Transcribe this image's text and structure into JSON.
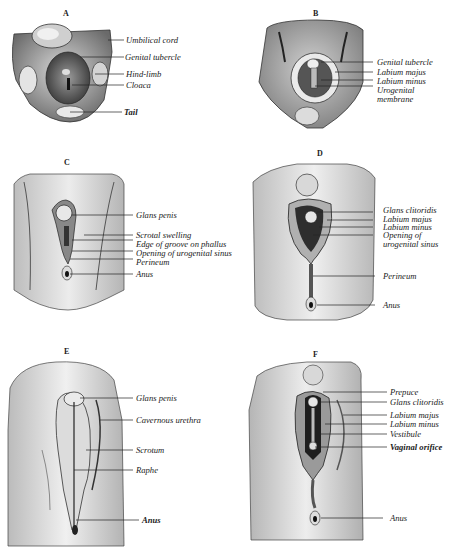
{
  "figure": {
    "panels": [
      {
        "id": "A",
        "letter": "A",
        "labels": [
          "Umbilical cord",
          "Genital tubercle",
          "Hind-limb",
          "Cloaca",
          "Tail"
        ]
      },
      {
        "id": "B",
        "letter": "B",
        "labels": [
          "Genital tubercle",
          "Labium majus",
          "Labium minus",
          "Urogenital",
          "membrane"
        ]
      },
      {
        "id": "C",
        "letter": "C",
        "labels": [
          "Glans penis",
          "Scrotal swelling",
          "Edge of groove on phallus",
          "Opening of urogenital sinus",
          "Perineum",
          "Anus"
        ]
      },
      {
        "id": "D",
        "letter": "D",
        "labels": [
          "Glans clitoridis",
          "Labium majus",
          "Labium minus",
          "Opening of",
          "urogenital sinus",
          "Perineum",
          "Anus"
        ]
      },
      {
        "id": "E",
        "letter": "E",
        "labels": [
          "Glans penis",
          "Cavernous urethra",
          "Scrotum",
          "Raphe",
          "Anus"
        ]
      },
      {
        "id": "F",
        "letter": "F",
        "labels": [
          "Prepuce",
          "Glans clitoridis",
          "Labium majus",
          "Labium minus",
          "Vestibule",
          "Vaginal orifice",
          "Anus"
        ]
      }
    ]
  },
  "colors": {
    "background": "#ffffff",
    "ink": "#1a1a1a",
    "tissue_light": "#e6e6e6",
    "tissue_mid": "#bdbdbd",
    "tissue_dark": "#555555"
  }
}
